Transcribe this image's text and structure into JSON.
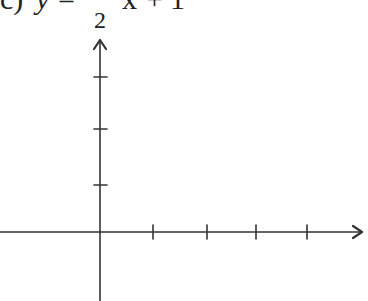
{
  "problem": {
    "label": "c)",
    "lhs": "y",
    "equals": "=",
    "coef_numerator": "1",
    "coef_denominator": "2",
    "variable": "x",
    "plus": "+",
    "constant": "1",
    "equation_text": "y = -1/2 x + 1"
  },
  "graph": {
    "x_axis": {
      "ticks_positive": 4,
      "arrow": "right"
    },
    "y_axis": {
      "ticks_positive": 3,
      "arrow": "up"
    },
    "line_color": "#333333"
  }
}
